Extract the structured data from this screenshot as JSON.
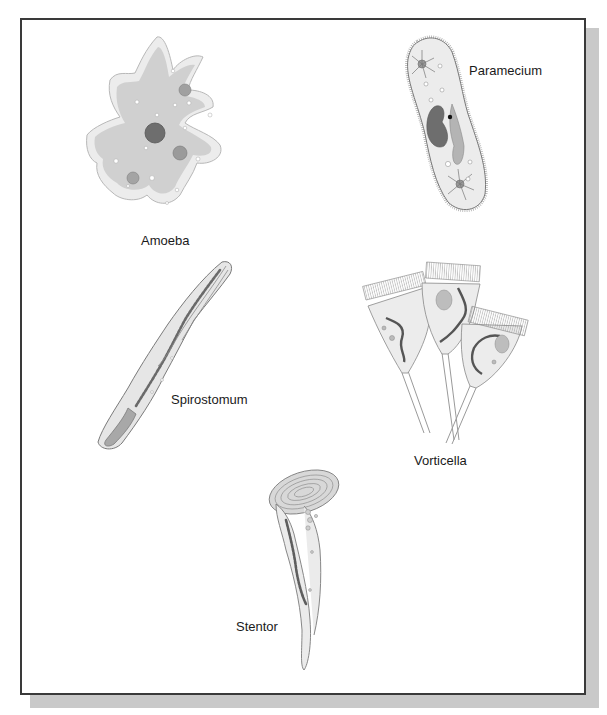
{
  "figure": {
    "organisms": [
      {
        "id": "amoeba",
        "label": "Amoeba"
      },
      {
        "id": "paramecium",
        "label": "Paramecium"
      },
      {
        "id": "spirostomum",
        "label": "Spirostomum"
      },
      {
        "id": "vorticella",
        "label": "Vorticella"
      },
      {
        "id": "stentor",
        "label": "Stentor"
      }
    ]
  },
  "colors": {
    "frame_border": "#3a3a3a",
    "shadow": "#c9c9c9",
    "cytoplasm": "#d2d2d2",
    "ectoplasm": "#e8e8e8",
    "nucleus": "#707070",
    "vacuole": "#a8a8a8",
    "outline": "#8a8a8a"
  }
}
